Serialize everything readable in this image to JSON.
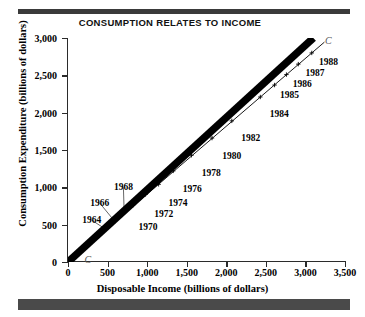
{
  "chart_data": {
    "type": "scatter",
    "title": "CONSUMPTION RELATES TO INCOME",
    "xlabel": "Disposable Income (billions of dollars)",
    "ylabel": "Consumption Expenditure (billions of dollars)",
    "xlim": [
      0,
      3500
    ],
    "ylim": [
      0,
      3000
    ],
    "xticks": [
      "0",
      "500",
      "1,000",
      "1,500",
      "2,000",
      "2,500",
      "3,000",
      "3,500"
    ],
    "xtick_values": [
      0,
      500,
      1000,
      1500,
      2000,
      2500,
      3000,
      3500
    ],
    "yticks": [
      "0",
      "500",
      "1,000",
      "1,500",
      "2,000",
      "2,500",
      "3,000"
    ],
    "ytick_values": [
      0,
      500,
      1000,
      1500,
      2000,
      2500,
      3000
    ],
    "grid": false,
    "legend": "none",
    "series": [
      {
        "name": "C",
        "marker": "+",
        "points": [
          {
            "label": "1964",
            "x": 475,
            "y": 440,
            "lx": 300,
            "ly": 560,
            "leader": true
          },
          {
            "label": "1966",
            "x": 590,
            "y": 545,
            "lx": 400,
            "ly": 790,
            "leader": true
          },
          {
            "label": "1968",
            "x": 710,
            "y": 660,
            "lx": 700,
            "ly": 1000,
            "leader": true
          },
          {
            "label": "1970",
            "x": 820,
            "y": 760,
            "lx": 1010,
            "ly": 470,
            "leader": false
          },
          {
            "label": "1972",
            "x": 980,
            "y": 905,
            "lx": 1210,
            "ly": 640,
            "leader": false
          },
          {
            "label": "1974",
            "x": 1145,
            "y": 1040,
            "lx": 1390,
            "ly": 790,
            "leader": false
          },
          {
            "label": "1976",
            "x": 1330,
            "y": 1220,
            "lx": 1570,
            "ly": 975,
            "leader": false
          },
          {
            "label": "1978",
            "x": 1560,
            "y": 1430,
            "lx": 1810,
            "ly": 1190,
            "leader": false
          },
          {
            "label": "1980",
            "x": 1820,
            "y": 1660,
            "lx": 2070,
            "ly": 1420,
            "leader": false
          },
          {
            "label": "1982",
            "x": 2070,
            "y": 1890,
            "lx": 2310,
            "ly": 1660,
            "leader": false
          },
          {
            "label": "1984",
            "x": 2430,
            "y": 2210,
            "lx": 2670,
            "ly": 1980,
            "leader": false
          },
          {
            "label": "1985",
            "x": 2610,
            "y": 2370,
            "lx": 2800,
            "ly": 2230,
            "leader": false
          },
          {
            "label": "1986",
            "x": 2760,
            "y": 2510,
            "lx": 2960,
            "ly": 2380,
            "leader": false
          },
          {
            "label": "1987",
            "x": 2910,
            "y": 2650,
            "lx": 3120,
            "ly": 2530,
            "leader": false
          },
          {
            "label": "1988",
            "x": 3080,
            "y": 2800,
            "lx": 3290,
            "ly": 2680,
            "leader": false
          }
        ]
      }
    ],
    "curve_label": "C",
    "curve_label_top": {
      "x": 3290,
      "y": 2975
    },
    "curve_label_origin": {
      "x": 250,
      "y": 45
    },
    "wedge": {
      "from": [
        0,
        0
      ],
      "to": [
        3100,
        3000
      ],
      "style": "thick-black-band"
    },
    "line": {
      "from": [
        280,
        255
      ],
      "to": [
        3240,
        2945
      ],
      "style": "thin-black"
    }
  },
  "decor": {
    "bar_top": "#3a3a3a",
    "bar_bottom": "#4a4a4a"
  }
}
